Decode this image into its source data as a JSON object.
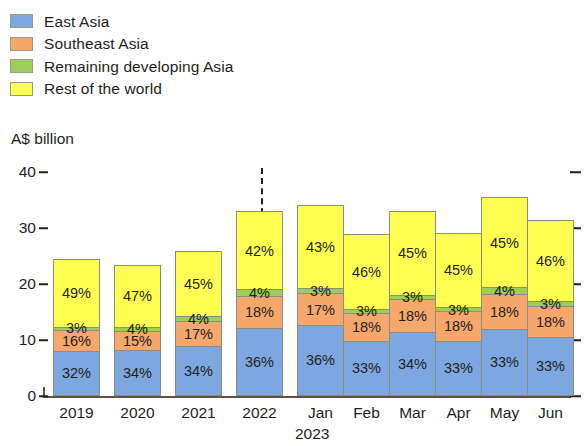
{
  "legend": {
    "items": [
      {
        "label": "East Asia",
        "color": "#7da7e0",
        "key": "east_asia"
      },
      {
        "label": "Southeast Asia",
        "color": "#f5a76c",
        "key": "southeast_asia"
      },
      {
        "label": "Remaining developing Asia",
        "color": "#9ccf5a",
        "key": "remaining_developing_asia"
      },
      {
        "label": "Rest of the world",
        "color": "#ffff52",
        "key": "rest_of_world"
      }
    ]
  },
  "axis": {
    "unit_label": "A$ billion",
    "y_ticks": [
      "40",
      "30",
      "20",
      "10",
      "0"
    ]
  },
  "x_axis": {
    "labels": [
      "2019",
      "2020",
      "2021",
      "2022",
      "Jan",
      "Feb",
      "Mar",
      "Apr",
      "May",
      "Jun"
    ],
    "sub_label": "2023"
  },
  "chart_data": {
    "type": "bar",
    "subtype": "stacked-percentage-labels",
    "title": "",
    "xlabel": "",
    "ylabel": "A$ billion",
    "ylim": [
      0,
      40
    ],
    "y_ticks": [
      0,
      10,
      20,
      30,
      40
    ],
    "grid": false,
    "legend_position": "top-left",
    "annotations": [
      "dashed vertical divider between 2022 and Jan 2023"
    ],
    "categories": [
      "2019",
      "2020",
      "2021",
      "2022",
      "Jan",
      "Feb",
      "Mar",
      "Apr",
      "May",
      "Jun"
    ],
    "totals": [
      25.0,
      24.0,
      26.5,
      33.5,
      35.0,
      29.5,
      33.5,
      30.0,
      36.0,
      32.0
    ],
    "series": [
      {
        "name": "East Asia",
        "color": "#7da7e0",
        "values": [
          32,
          34,
          34,
          36,
          36,
          33,
          34,
          33,
          33,
          33
        ],
        "unit": "%"
      },
      {
        "name": "Southeast Asia",
        "color": "#f5a76c",
        "values": [
          16,
          15,
          17,
          18,
          17,
          18,
          18,
          18,
          18,
          18
        ],
        "unit": "%"
      },
      {
        "name": "Remaining developing Asia",
        "color": "#9ccf5a",
        "values": [
          3,
          4,
          4,
          4,
          3,
          3,
          3,
          3,
          4,
          3
        ],
        "unit": "%"
      },
      {
        "name": "Rest of the world",
        "color": "#ffff52",
        "values": [
          49,
          47,
          45,
          42,
          43,
          46,
          45,
          45,
          45,
          46
        ],
        "unit": "%"
      }
    ],
    "data_labels": {
      "2019": {
        "East Asia": "32%",
        "Southeast Asia": "16%",
        "Remaining developing Asia": "3%",
        "Rest of the world": "49%"
      },
      "2020": {
        "East Asia": "34%",
        "Southeast Asia": "15%",
        "Remaining developing Asia": "4%",
        "Rest of the world": "47%"
      },
      "2021": {
        "East Asia": "34%",
        "Southeast Asia": "17%",
        "Remaining developing Asia": "4%",
        "Rest of the world": "45%"
      },
      "2022": {
        "East Asia": "36%",
        "Southeast Asia": "18%",
        "Remaining developing Asia": "4%",
        "Rest of the world": "42%"
      },
      "Jan": {
        "East Asia": "36%",
        "Southeast Asia": "17%",
        "Remaining developing Asia": "3%",
        "Rest of the world": "43%"
      },
      "Feb": {
        "East Asia": "33%",
        "Southeast Asia": "18%",
        "Remaining developing Asia": "3%",
        "Rest of the world": "46%"
      },
      "Mar": {
        "East Asia": "34%",
        "Southeast Asia": "18%",
        "Remaining developing Asia": "3%",
        "Rest of the world": "45%"
      },
      "Apr": {
        "East Asia": "33%",
        "Southeast Asia": "18%",
        "Remaining developing Asia": "3%",
        "Rest of the world": "45%"
      },
      "May": {
        "East Asia": "33%",
        "Southeast Asia": "18%",
        "Remaining developing Asia": "4%",
        "Rest of the world": "45%"
      },
      "Jun": {
        "East Asia": "33%",
        "Southeast Asia": "18%",
        "Remaining developing Asia": "3%",
        "Rest of the world": "46%"
      }
    }
  },
  "layout": {
    "plot_left": 53,
    "plot_right": 567,
    "baseline_y": 396,
    "top_value_y": 172,
    "bar_width": 47,
    "bar_x": [
      53,
      114,
      175,
      236,
      297,
      343,
      389,
      435,
      481,
      527
    ],
    "divider_x": 261,
    "divider_top": 168
  }
}
